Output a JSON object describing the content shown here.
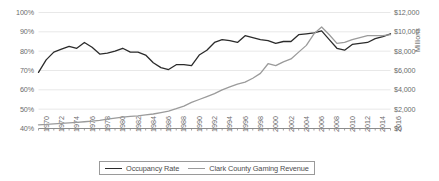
{
  "chart_data": {
    "type": "line",
    "title": "",
    "subtitle": "",
    "xlabel": "",
    "ylabel": "",
    "y2label": "Millions",
    "grid": true,
    "legend_position": "bottom",
    "x": [
      1970,
      1971,
      1972,
      1973,
      1974,
      1975,
      1976,
      1977,
      1978,
      1979,
      1980,
      1981,
      1982,
      1983,
      1984,
      1985,
      1986,
      1987,
      1988,
      1989,
      1990,
      1991,
      1992,
      1993,
      1994,
      1995,
      1996,
      1997,
      1998,
      1999,
      2000,
      2001,
      2002,
      2003,
      2004,
      2005,
      2006,
      2007,
      2008,
      2009,
      2010,
      2011,
      2012,
      2013,
      2014,
      2015,
      2016
    ],
    "xtick_labels": [
      "1970",
      "1972",
      "1974",
      "1976",
      "1978",
      "1980",
      "1982",
      "1984",
      "1986",
      "1988",
      "1990",
      "1992",
      "1994",
      "1996",
      "1998",
      "2000",
      "2002",
      "2004",
      "2006",
      "2008",
      "2010",
      "2012",
      "2014",
      "2016"
    ],
    "xtick_values": [
      1970,
      1972,
      1974,
      1976,
      1978,
      1980,
      1982,
      1984,
      1986,
      1988,
      1990,
      1992,
      1994,
      1996,
      1998,
      2000,
      2002,
      2004,
      2006,
      2008,
      2010,
      2012,
      2014,
      2016
    ],
    "axes": {
      "left": {
        "label_format": "percent",
        "ylim": [
          40,
          100
        ],
        "tick_labels": [
          "100%",
          "90%",
          "80%",
          "70%",
          "60%",
          "50%",
          "40%"
        ],
        "tick_values": [
          100,
          90,
          80,
          70,
          60,
          50,
          40
        ]
      },
      "right": {
        "label_format": "currency_millions",
        "ylim": [
          0,
          12000
        ],
        "tick_labels": [
          "$12,000",
          "$10,000",
          "$8,000",
          "$6,000",
          "$4,000",
          "$2,000",
          "$0"
        ],
        "tick_values": [
          12000,
          10000,
          8000,
          6000,
          4000,
          2000,
          0
        ]
      }
    },
    "series": [
      {
        "name": "Occupancy Rate",
        "axis": "left",
        "color": "#2b2b2b",
        "unit": "percent",
        "values": [
          69.0,
          75.5,
          79.5,
          81.0,
          82.5,
          81.5,
          84.5,
          82.0,
          78.5,
          79.0,
          80.0,
          81.5,
          79.5,
          79.5,
          78.0,
          74.0,
          71.5,
          70.5,
          73.0,
          73.0,
          72.5,
          78.0,
          80.5,
          84.5,
          86.0,
          85.5,
          84.5,
          88.0,
          87.0,
          86.0,
          85.5,
          84.0,
          85.0,
          85.0,
          88.5,
          89.0,
          89.5,
          90.5,
          86.0,
          81.5,
          80.5,
          83.5,
          84.0,
          84.5,
          86.5,
          87.5,
          89.0
        ]
      },
      {
        "name": "Clark County Gaming Revenue",
        "axis": "right",
        "color": "#9b9b9b",
        "unit": "millions_usd",
        "values": [
          380,
          420,
          480,
          540,
          590,
          640,
          700,
          760,
          850,
          960,
          1080,
          1180,
          1250,
          1300,
          1400,
          1500,
          1650,
          1800,
          2050,
          2320,
          2700,
          3000,
          3300,
          3600,
          4000,
          4300,
          4600,
          4800,
          5200,
          5700,
          6700,
          6500,
          6900,
          7200,
          7900,
          8600,
          9800,
          10500,
          9700,
          8800,
          8900,
          9200,
          9400,
          9600,
          9600,
          9600,
          9700
        ]
      }
    ],
    "annotations": []
  },
  "legend": {
    "entries": [
      {
        "label": "Occupancy Rate",
        "color": "#2b2b2b"
      },
      {
        "label": "Clark County Gaming Revenue",
        "color": "#9b9b9b"
      }
    ]
  },
  "colors": {
    "gridline": "#e8e8e8",
    "axis": "#8c8c8c",
    "tick_text": "#6b6b6b",
    "occupancy": "#2b2b2b",
    "revenue": "#9b9b9b",
    "background": "#ffffff"
  }
}
